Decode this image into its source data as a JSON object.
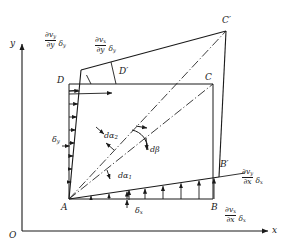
{
  "figure": {
    "type": "diagram",
    "width": 289,
    "height": 248,
    "background": "#ffffff",
    "line_color": "#1a1a1a",
    "text_color": "#1a1a1a"
  },
  "axes": {
    "origin_label": "O",
    "x_label": "x",
    "y_label": "y"
  },
  "vertices": {
    "A": "A",
    "B": "B",
    "C": "C",
    "D": "D",
    "B_prime": "B′",
    "C_prime": "C′",
    "D_prime": "D′"
  },
  "lengths": {
    "dx": "δ",
    "dx_sub": "x",
    "dy": "δ",
    "dy_sub": "y"
  },
  "angles": {
    "dalpha1": "dα",
    "dalpha1_sub": "1",
    "dalpha2": "dα",
    "dalpha2_sub": "2",
    "dbeta": "dβ"
  },
  "gradient_labels": [
    {
      "id": "dvy-dy",
      "numerator": "∂v",
      "numerator_sub": "y",
      "denominator": "∂y",
      "tail": "δ",
      "tail_sub": "y",
      "position": "top-left",
      "meaning": "normal strain rate term on the left face (∂v_y/∂y)·δ_y"
    },
    {
      "id": "dvx-dy",
      "numerator": "∂v",
      "numerator_sub": "x",
      "denominator": "∂y",
      "tail": "δ",
      "tail_sub": "y",
      "position": "top-centre",
      "meaning": "shear term on the top face (∂v_x/∂y)·δ_y"
    },
    {
      "id": "dvy-dx",
      "numerator": "∂v",
      "numerator_sub": "y",
      "denominator": "∂x",
      "tail": "δ",
      "tail_sub": "x",
      "position": "right",
      "meaning": "shear term on the right face (∂v_y/∂x)·δ_x"
    },
    {
      "id": "dvx-dx",
      "numerator": "∂v",
      "numerator_sub": "x",
      "denominator": "∂x",
      "tail": "δ",
      "tail_sub": "x",
      "position": "bottom-right",
      "meaning": "normal strain rate term along the bottom face (∂v_x/∂x)·δ_x"
    }
  ]
}
